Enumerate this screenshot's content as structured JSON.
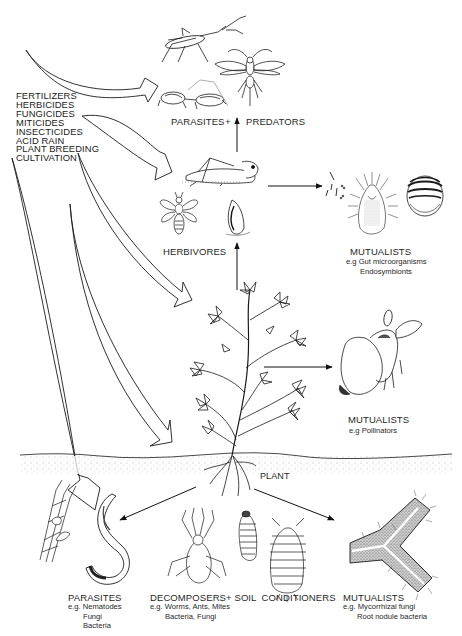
{
  "diagram": {
    "type": "ecological-interaction-diagram",
    "inputs": {
      "items": [
        "FERTILIZERS",
        "HERBICIDES",
        "FUNGICIDES",
        "MITICIDES",
        "INSECTICIDES",
        "ACID RAIN",
        "PLANT BREEDING",
        "CULTIVATION"
      ]
    },
    "nodes": {
      "parasites_predators": {
        "label_left": "PARASITES",
        "plus": "+",
        "label_right": "PREDATORS"
      },
      "herbivores": {
        "label": "HERBIVORES"
      },
      "mutualists_gut": {
        "label": "MUTUALISTS",
        "examples_prefix": "e.g",
        "examples": [
          "Gut microorganisms",
          "Endosymbionts"
        ]
      },
      "mutualists_pollinators": {
        "label": "MUTUALISTS",
        "examples_prefix": "e.g",
        "examples": [
          "Pollinators"
        ]
      },
      "plant": {
        "label": "PLANT"
      },
      "parasites_soil": {
        "label": "PARASITES",
        "examples_prefix": "e.g.",
        "examples": [
          "Nematodes",
          "Fungi",
          "Bacteria"
        ]
      },
      "decomposers": {
        "label": "DECOMPOSERS+ SOIL  CONDITIONERS",
        "examples_prefix": "e.g.",
        "examples": [
          "Worms, Ants, Mites",
          "Bacteria, Fungi"
        ]
      },
      "mutualists_root": {
        "label": "MUTUALISTS",
        "examples_prefix": "e.g.",
        "examples": [
          "Mycorrhizal fungi",
          "Root nodule bacteria"
        ]
      }
    },
    "edges": [
      {
        "from": "inputs",
        "to": "parasites_predators",
        "style": "broad-arrow"
      },
      {
        "from": "inputs",
        "to": "herbivores",
        "style": "broad-arrow"
      },
      {
        "from": "inputs",
        "to": "plant",
        "style": "broad-arrow"
      },
      {
        "from": "inputs",
        "to": "plant-lower",
        "style": "broad-arrow"
      },
      {
        "from": "inputs",
        "to": "parasites_soil",
        "style": "broad-arrow"
      },
      {
        "from": "herbivores",
        "to": "parasites_predators",
        "style": "line-arrow"
      },
      {
        "from": "plant",
        "to": "herbivores",
        "style": "line-arrow"
      },
      {
        "from": "herbivores",
        "to": "mutualists_gut",
        "style": "line-arrow"
      },
      {
        "from": "plant",
        "to": "mutualists_pollinators",
        "style": "line-arrow"
      },
      {
        "from": "plant",
        "to": "parasites_soil",
        "style": "line-arrow"
      },
      {
        "from": "plant",
        "to": "mutualists_root",
        "style": "line-arrow"
      }
    ],
    "illustrations": [
      "assassin-bug",
      "parasitic-wasp",
      "praying-mantis",
      "grasshopper",
      "thrips",
      "aphid",
      "gut-bacteria",
      "tick-mite",
      "scale-insect",
      "plant",
      "bee-on-flower",
      "fungal-hyphae",
      "nematode",
      "mite",
      "grub",
      "sowbug",
      "mycorrhizal-root"
    ]
  }
}
